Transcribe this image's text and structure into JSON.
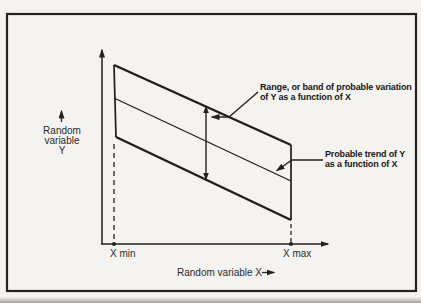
{
  "figure": {
    "paper_color": "#f4f3ef",
    "ink_color": "#222222",
    "y_axis": {
      "label_lines": [
        "Random",
        "variable",
        "Y"
      ],
      "arrow_icon": "up-arrow"
    },
    "x_axis": {
      "label": "Random variable X",
      "arrow_icon": "right-arrow",
      "min_tick_label": "X min",
      "max_tick_label": "X max"
    },
    "callouts": {
      "range_band": {
        "line1": "Range, or band of probable variation",
        "line2": "of Y as a function of X"
      },
      "trend": {
        "line1": "Probable trend of Y",
        "line2": "as a function of X"
      }
    }
  }
}
